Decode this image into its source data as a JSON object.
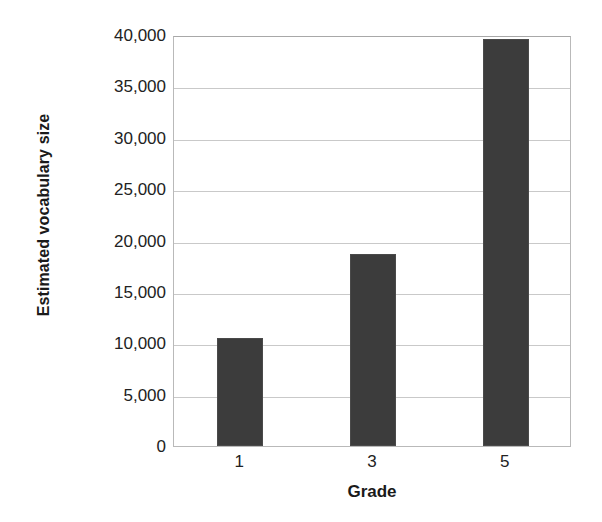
{
  "chart_data": {
    "type": "bar",
    "title": "",
    "subtitle": "",
    "categories": [
      "1",
      "3",
      "5"
    ],
    "values": [
      10500,
      18700,
      39600
    ],
    "series": [
      {
        "name": "Estimated vocabulary size",
        "values": [
          10500,
          18700,
          39600
        ]
      }
    ],
    "xlabel": "Grade",
    "ylabel": "Estimated vocabulary size",
    "ylim": [
      0,
      40000
    ],
    "ytick_values": [
      0,
      5000,
      10000,
      15000,
      20000,
      25000,
      30000,
      35000,
      40000
    ],
    "ytick_labels": [
      "0",
      "5,000",
      "10,000",
      "15,000",
      "20,000",
      "25,000",
      "30,000",
      "35,000",
      "40,000"
    ],
    "xtick_labels": [
      "1",
      "3",
      "5"
    ],
    "grid": true,
    "grid_axis": "y",
    "legend": false,
    "legend_position": "none",
    "bar_color": "#3c3c3c",
    "gridline_color": "#c9c9c9",
    "axis_color": "#b9b9b9",
    "background_color": "#ffffff",
    "annotations": []
  }
}
